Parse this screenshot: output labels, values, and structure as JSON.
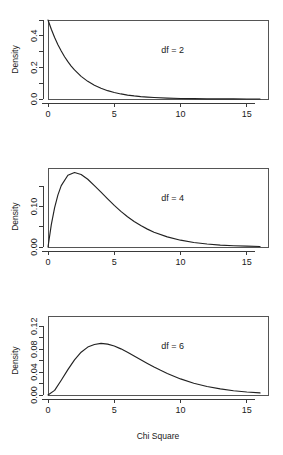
{
  "figure": {
    "background": "#ffffff",
    "line_color": "#222222",
    "axis_color": "#3a3a3a",
    "panel_count": 3
  },
  "chart_data": [
    {
      "type": "line",
      "title": "",
      "xlabel": "",
      "ylabel": "Density",
      "annotation": "df = 2",
      "xlim": [
        0,
        16.6
      ],
      "ylim": [
        0,
        0.5
      ],
      "xticks": [
        0,
        5,
        10,
        15
      ],
      "xticklabels": [
        "0",
        "5",
        "10",
        "15"
      ],
      "yticks": [
        0.0,
        0.1,
        0.2,
        0.3,
        0.4,
        0.5
      ],
      "yticklabels": [
        "0.0",
        "",
        "0.2",
        "",
        "0.4",
        ""
      ],
      "grid": false,
      "legend": "none",
      "series": [
        {
          "name": "Chi-square df=2 density",
          "x": [
            0,
            0.25,
            0.5,
            0.75,
            1,
            1.25,
            1.5,
            1.75,
            2,
            2.5,
            3,
            3.5,
            4,
            4.5,
            5,
            5.5,
            6,
            6.5,
            7,
            7.5,
            8,
            9,
            10,
            11,
            12,
            13,
            14,
            15,
            16
          ],
          "y": [
            0.5,
            0.4412,
            0.3894,
            0.3436,
            0.3033,
            0.2676,
            0.2362,
            0.2084,
            0.1839,
            0.1433,
            0.1116,
            0.0869,
            0.0677,
            0.0527,
            0.041,
            0.032,
            0.0249,
            0.0194,
            0.0151,
            0.0118,
            0.0092,
            0.0056,
            0.0034,
            0.002,
            0.0012,
            0.0008,
            0.0005,
            0.0003,
            0.0002
          ]
        }
      ]
    },
    {
      "type": "line",
      "title": "",
      "xlabel": "",
      "ylabel": "Density",
      "annotation": "df = 4",
      "xlim": [
        0,
        16.6
      ],
      "ylim": [
        0,
        0.195
      ],
      "xticks": [
        0,
        5,
        10,
        15
      ],
      "xticklabels": [
        "0",
        "5",
        "10",
        "15"
      ],
      "yticks": [
        0.0,
        0.05,
        0.1,
        0.15
      ],
      "yticklabels": [
        "0.00",
        "",
        "0.10",
        ""
      ],
      "grid": false,
      "legend": "none",
      "series": [
        {
          "name": "Chi-square df=4 density",
          "x": [
            0,
            0.25,
            0.5,
            0.75,
            1,
            1.5,
            2,
            2.5,
            3,
            3.5,
            4,
            4.5,
            5,
            5.5,
            6,
            6.5,
            7,
            7.5,
            8,
            9,
            10,
            11,
            12,
            13,
            14,
            15,
            16
          ],
          "y": [
            0,
            0.0551,
            0.0973,
            0.1288,
            0.1516,
            0.1772,
            0.1839,
            0.1791,
            0.1673,
            0.1516,
            0.1353,
            0.1187,
            0.1026,
            0.0879,
            0.0747,
            0.063,
            0.0528,
            0.0441,
            0.0366,
            0.025,
            0.0168,
            0.0112,
            0.0074,
            0.0048,
            0.0032,
            0.0021,
            0.0013
          ]
        }
      ]
    },
    {
      "type": "line",
      "title": "",
      "xlabel": "Chi Square",
      "ylabel": "Density",
      "annotation": "df = 6",
      "xlim": [
        0,
        16.6
      ],
      "ylim": [
        0,
        0.138
      ],
      "xticks": [
        0,
        5,
        10,
        15
      ],
      "xticklabels": [
        "0",
        "5",
        "10",
        "15"
      ],
      "yticks": [
        0.0,
        0.02,
        0.04,
        0.06,
        0.08,
        0.1,
        0.12
      ],
      "yticklabels": [
        "0.00",
        "",
        "0.04",
        "",
        "0.08",
        "",
        "0.12"
      ],
      "grid": false,
      "legend": "none",
      "series": [
        {
          "name": "Chi-square df=6 density",
          "x": [
            0,
            0.5,
            1,
            1.5,
            2,
            2.5,
            3,
            3.5,
            4,
            4.5,
            5,
            5.5,
            6,
            6.5,
            7,
            7.5,
            8,
            8.5,
            9,
            10,
            11,
            12,
            13,
            14,
            15,
            16
          ],
          "y": [
            0,
            0.0081,
            0.0258,
            0.0443,
            0.0613,
            0.0747,
            0.0837,
            0.0883,
            0.0902,
            0.0888,
            0.0855,
            0.0806,
            0.0747,
            0.0682,
            0.0617,
            0.0552,
            0.0489,
            0.0431,
            0.0377,
            0.0281,
            0.0206,
            0.0149,
            0.0106,
            0.0074,
            0.0052,
            0.0036
          ]
        }
      ]
    }
  ]
}
